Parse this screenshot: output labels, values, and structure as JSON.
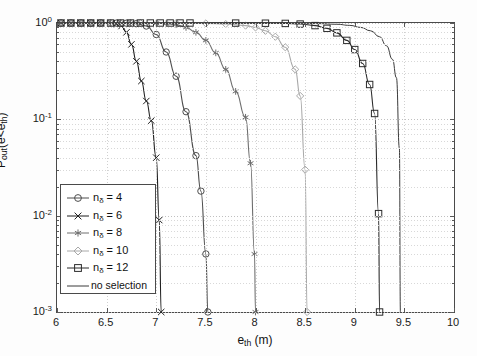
{
  "chart_data": {
    "type": "line",
    "title": "",
    "xlabel": "e_th (m)",
    "ylabel": "P_out(e<e_th)",
    "xlim": [
      6,
      10
    ],
    "ylim": [
      0.001,
      1
    ],
    "yscale": "log",
    "xscale": "linear",
    "grid": true,
    "legend_position": "lower-left-inside",
    "xticks": [
      "6",
      "6.5",
      "7",
      "7.5",
      "8",
      "8.5",
      "9",
      "9.5",
      "10"
    ],
    "xtick_values": [
      6,
      6.5,
      7,
      7.5,
      8,
      8.5,
      9,
      9.5,
      10
    ],
    "yticks": [
      "10^0",
      "10^-1",
      "10^-2",
      "10^-3"
    ],
    "ytick_values": [
      1,
      0.1,
      0.01,
      0.001
    ],
    "series": [
      {
        "name": "n_delta = 4",
        "marker": "circle",
        "color": "#4d4d4d",
        "x": [
          6.0,
          6.1,
          6.2,
          6.3,
          6.4,
          6.5,
          6.6,
          6.7,
          6.8,
          6.9,
          7.0,
          7.1,
          7.2,
          7.3,
          7.4,
          7.45,
          7.5,
          7.52
        ],
        "y": [
          1.0,
          1.0,
          1.0,
          1.0,
          1.0,
          0.999,
          0.998,
          0.995,
          0.985,
          0.93,
          0.76,
          0.5,
          0.28,
          0.12,
          0.042,
          0.018,
          0.004,
          0.001
        ]
      },
      {
        "name": "n_delta = 6",
        "marker": "x",
        "color": "#1f1f1f",
        "x": [
          6.0,
          6.1,
          6.2,
          6.3,
          6.4,
          6.5,
          6.55,
          6.6,
          6.65,
          6.7,
          6.75,
          6.8,
          6.85,
          6.9,
          6.95,
          7.0,
          7.03,
          7.05
        ],
        "y": [
          1.0,
          1.0,
          1.0,
          1.0,
          1.0,
          0.999,
          0.995,
          0.98,
          0.93,
          0.8,
          0.6,
          0.4,
          0.25,
          0.155,
          0.097,
          0.04,
          0.009,
          0.001
        ]
      },
      {
        "name": "n_delta = 8",
        "marker": "asterisk",
        "color": "#6e6e6e",
        "x": [
          6.0,
          6.2,
          6.4,
          6.6,
          6.8,
          7.0,
          7.1,
          7.2,
          7.3,
          7.4,
          7.5,
          7.6,
          7.7,
          7.8,
          7.9,
          7.95,
          7.99,
          8.0
        ],
        "y": [
          1.0,
          1.0,
          1.0,
          1.0,
          0.999,
          0.995,
          0.985,
          0.96,
          0.9,
          0.8,
          0.66,
          0.49,
          0.33,
          0.195,
          0.105,
          0.035,
          0.004,
          0.001
        ]
      },
      {
        "name": "n_delta = 10",
        "marker": "diamond",
        "color": "#a8a8a8",
        "x": [
          6.0,
          6.3,
          6.6,
          6.9,
          7.2,
          7.5,
          7.7,
          7.9,
          8.0,
          8.1,
          8.2,
          8.3,
          8.4,
          8.45,
          8.5,
          8.52
        ],
        "y": [
          1.0,
          1.0,
          1.0,
          0.999,
          0.997,
          0.99,
          0.975,
          0.94,
          0.9,
          0.83,
          0.72,
          0.56,
          0.33,
          0.175,
          0.03,
          0.001
        ]
      },
      {
        "name": "n_delta = 12",
        "marker": "square",
        "color": "#2b2b2b",
        "x": [
          6.0,
          6.5,
          7.0,
          7.4,
          7.8,
          8.1,
          8.3,
          8.45,
          8.6,
          8.72,
          8.82,
          8.92,
          9.0,
          9.08,
          9.15,
          9.2,
          9.24,
          9.25
        ],
        "y": [
          1.0,
          1.0,
          1.0,
          0.999,
          0.998,
          0.995,
          0.99,
          0.975,
          0.94,
          0.88,
          0.79,
          0.66,
          0.53,
          0.38,
          0.23,
          0.115,
          0.0105,
          0.001
        ]
      },
      {
        "name": "no selection",
        "marker": "none",
        "color": "#3a3a3a",
        "x": [
          6.0,
          6.5,
          7.0,
          7.5,
          7.9,
          8.2,
          8.45,
          8.65,
          8.82,
          8.95,
          9.06,
          9.16,
          9.25,
          9.32,
          9.38,
          9.42,
          9.45,
          9.46
        ],
        "y": [
          1.0,
          1.0,
          1.0,
          0.999,
          0.998,
          0.996,
          0.992,
          0.985,
          0.97,
          0.945,
          0.9,
          0.83,
          0.72,
          0.58,
          0.42,
          0.27,
          0.05,
          0.001
        ]
      }
    ]
  },
  "axis": {
    "x_title_main": "e",
    "x_title_sub": "th",
    "x_title_unit": " (m)",
    "y_title_p": "P",
    "y_title_psub": "out",
    "y_title_open": "(e<e",
    "y_title_esub": "th",
    "y_title_close": ")"
  },
  "legend": {
    "entries": [
      {
        "label_main": "n",
        "label_sub": "δ",
        "label_eq": " = 4",
        "marker": "circle",
        "color": "#4d4d4d"
      },
      {
        "label_main": "n",
        "label_sub": "δ",
        "label_eq": " = 6",
        "marker": "x",
        "color": "#1f1f1f"
      },
      {
        "label_main": "n",
        "label_sub": "δ",
        "label_eq": " = 8",
        "marker": "asterisk",
        "color": "#6e6e6e"
      },
      {
        "label_main": "n",
        "label_sub": "δ",
        "label_eq": " = 10",
        "marker": "diamond",
        "color": "#a8a8a8"
      },
      {
        "label_main": "n",
        "label_sub": "δ",
        "label_eq": " = 12",
        "marker": "square",
        "color": "#2b2b2b"
      },
      {
        "label_main": "no selection",
        "label_sub": "",
        "label_eq": "",
        "marker": "none",
        "color": "#3a3a3a"
      }
    ]
  }
}
